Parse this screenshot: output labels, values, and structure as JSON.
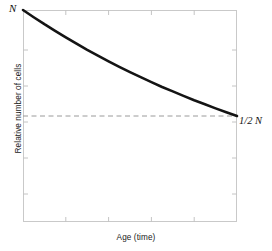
{
  "chart_data": {
    "type": "line",
    "title": "",
    "subtitle": "",
    "xlabel": "Age (time)",
    "ylabel": "Relative number of cells",
    "xlim": [
      0,
      1
    ],
    "ylim": [
      0,
      1
    ],
    "grid": false,
    "legend": null,
    "x_tick_labels": [],
    "y_tick_labels": [],
    "series": [
      {
        "name": "Relative number of cells",
        "style": "solid",
        "color": "#141414",
        "width": 2.6,
        "x": [
          0.0,
          0.05,
          0.1,
          0.15,
          0.2,
          0.25,
          0.3,
          0.35,
          0.4,
          0.45,
          0.5,
          0.55,
          0.6,
          0.65,
          0.7,
          0.75,
          0.8,
          0.85,
          0.9,
          0.95,
          1.0
        ],
        "y": [
          1.0,
          0.966,
          0.933,
          0.902,
          0.871,
          0.841,
          0.812,
          0.785,
          0.758,
          0.732,
          0.707,
          0.683,
          0.66,
          0.637,
          0.616,
          0.595,
          0.574,
          0.555,
          0.536,
          0.518,
          0.5
        ]
      }
    ],
    "reference_lines": [
      {
        "name": "half-n-reference",
        "orientation": "horizontal",
        "y": 0.5,
        "style": "dashed",
        "color": "#9a9a9a",
        "label": "1/2 N"
      }
    ],
    "annotations": [
      {
        "name": "start-value",
        "text": "N",
        "x": 0.0,
        "y": 1.0
      },
      {
        "name": "end-value",
        "text": "1/2 N",
        "x": 1.0,
        "y": 0.5
      }
    ],
    "ticks": {
      "top": [
        0.0,
        0.2,
        0.4,
        0.6,
        0.8,
        1.0
      ],
      "bottom": [
        0.0,
        0.2,
        0.4,
        0.6,
        0.8,
        1.0
      ],
      "left": [
        0.0,
        0.17,
        0.33,
        0.5,
        0.67,
        0.83,
        1.0
      ],
      "right": [
        0.0,
        0.17,
        0.33,
        0.5,
        0.67,
        0.83,
        1.0
      ],
      "direction": "inward",
      "color": "#c4c4c4"
    },
    "frame": {
      "color": "#c9c9c9",
      "visible": true
    },
    "background": "#ffffff"
  }
}
